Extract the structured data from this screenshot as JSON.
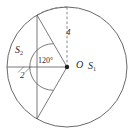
{
  "figure": {
    "kind": "circle-segment-geometry-diagram",
    "background_color": "#ffffff",
    "stroke_color": "#4a4a4a",
    "text_color": "#2b2b2b"
  },
  "labels": {
    "center_point": "O",
    "major_segment": "S",
    "major_segment_sub": "1",
    "minor_segment": "S",
    "minor_segment_sub": "2",
    "central_angle": "120°",
    "radius_value": "4",
    "apothem_value": "2"
  },
  "geometry": {
    "circle": {
      "cx": 67,
      "cy": 67,
      "r": 60
    },
    "center_dot": {
      "cx": 67,
      "cy": 67,
      "r": 2.2
    },
    "chord": {
      "x": 37,
      "y_top": 15.05,
      "y_bottom": 118.95
    },
    "radius_upper": {
      "x1": 67,
      "y1": 67,
      "x2": 37,
      "y2": 15.05
    },
    "radius_lower": {
      "x1": 67,
      "y1": 67,
      "x2": 37,
      "y2": 118.95
    },
    "apothem_line": {
      "x1": 7,
      "y1": 67,
      "x2": 67,
      "y2": 67
    },
    "dashed_arc": {
      "from_x": 37,
      "from_y": 15.05,
      "to_x": 67,
      "to_y": 7,
      "radius": 60,
      "description": "dashed arc from chord top endpoint to top of circle indicating radius 4"
    },
    "angle_arc": {
      "cx": 67,
      "cy": 67,
      "r": 14,
      "description": "arc between the two radii marking the 120 degree central angle"
    },
    "apothem_tick": {
      "cx": 22,
      "cy": 67,
      "description": "small tick marking the apothem distance of 2"
    }
  }
}
